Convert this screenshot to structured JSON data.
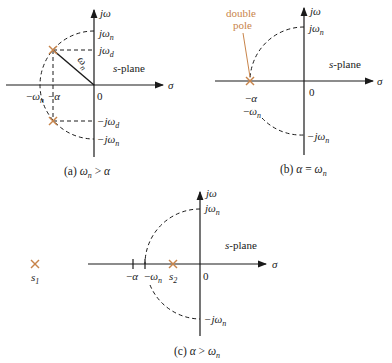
{
  "figure": {
    "colors": {
      "axis": "#1a1a1a",
      "pole": "#c8844a",
      "dashed": "#1a1a1a",
      "annotation": "#c8844a"
    },
    "panels": [
      {
        "id": "a",
        "caption": "(a)  ωₙ > α",
        "caption_prefix": "(a)",
        "caption_expr": "ωn > α",
        "plane_label": "s-plane",
        "axis_x_label": "σ",
        "axis_y_label": "jω",
        "origin_label": "0",
        "y_ticks": [
          "jωn",
          "jωd",
          "−jωd",
          "−jωn"
        ],
        "x_ticks": [
          "−ωn",
          "−α"
        ],
        "radius_label": "ωn",
        "poles": [
          "−α + jωd",
          "−α − jωd"
        ]
      },
      {
        "id": "b",
        "caption": "(b)  α = ωn",
        "caption_prefix": "(b)",
        "caption_expr": "α = ωn",
        "plane_label": "s-plane",
        "axis_x_label": "σ",
        "axis_y_label": "jω",
        "origin_label": "0",
        "y_ticks": [
          "jωn",
          "−jωn"
        ],
        "x_ticks": [
          "−α",
          "−ωn"
        ],
        "annotation": "double pole",
        "annotation_line1": "double",
        "annotation_line2": "pole",
        "poles": [
          "−α (double)"
        ]
      },
      {
        "id": "c",
        "caption": "(c)  α > ωn",
        "caption_prefix": "(c)",
        "caption_expr": "α > ωn",
        "plane_label": "s-plane",
        "axis_x_label": "σ",
        "axis_y_label": "jω",
        "origin_label": "0",
        "y_ticks": [
          "jωn",
          "−jωn"
        ],
        "x_ticks": [
          "−α",
          "−ωn"
        ],
        "poles": [
          "s1",
          "s2"
        ]
      }
    ]
  }
}
